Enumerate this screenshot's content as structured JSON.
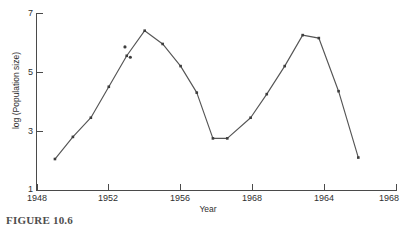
{
  "figure": {
    "caption": "FIGURE 10.6"
  },
  "chart_data": {
    "type": "line",
    "title": "",
    "subtitle": "",
    "xlabel": "Year",
    "ylabel": "log (Population size)",
    "xlim": [
      1948,
      1968
    ],
    "ylim": [
      1,
      7
    ],
    "grid": false,
    "legend": null,
    "legend_position": "none",
    "x_tick_labels": [
      "1948",
      "1952",
      "1956",
      "1968",
      "1964",
      "1968"
    ],
    "x_tick_values": [
      1948,
      1952,
      1956,
      1960,
      1964,
      1968
    ],
    "y_tick_labels": [
      "7",
      "5",
      "3",
      "1"
    ],
    "y_tick_values": [
      7,
      5,
      3,
      1
    ],
    "marker": "square",
    "line_color": "#555555",
    "marker_color": "#3d3d3d",
    "series": [
      {
        "name": "Population",
        "x": [
          1949.0,
          1950.0,
          1951.0,
          1952.0,
          1953.0,
          1954.0,
          1955.0,
          1956.0,
          1956.9,
          1957.8,
          1958.6,
          1959.9,
          1960.8,
          1961.8,
          1962.8,
          1963.7,
          1964.8,
          1965.9
        ],
        "y": [
          2.05,
          2.8,
          3.45,
          4.5,
          5.55,
          6.4,
          5.95,
          5.2,
          4.3,
          2.75,
          2.75,
          3.45,
          4.25,
          5.2,
          6.25,
          6.15,
          4.35,
          2.1
        ]
      },
      {
        "name": "Outlier observations",
        "x": [
          1952.9,
          1953.2
        ],
        "y": [
          5.85,
          5.5
        ]
      }
    ],
    "annotations": []
  }
}
